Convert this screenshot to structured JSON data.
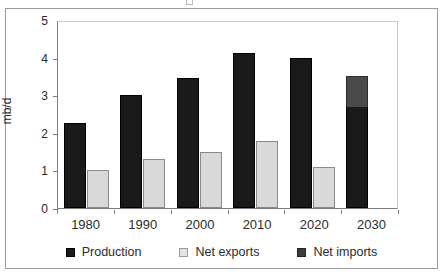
{
  "figure": {
    "background": "#ffffff",
    "frame_color": "#9a9a9a"
  },
  "chart_data": {
    "type": "bar",
    "title": "",
    "subtitle": "",
    "xlabel": "",
    "ylabel": "mb/d",
    "categories": [
      "1980",
      "1990",
      "2000",
      "2010",
      "2020",
      "2030"
    ],
    "ylim": [
      0,
      5
    ],
    "yticks": [
      "0",
      "1",
      "2",
      "3",
      "4",
      "5"
    ],
    "grid": false,
    "legend_position": "bottom",
    "stacked_note": "Net imports is stacked on top of Production in 2030 only",
    "series": [
      {
        "name": "Production",
        "color": "#1a1a1a",
        "values": [
          2.25,
          3.0,
          3.45,
          4.12,
          3.98,
          2.72
        ]
      },
      {
        "name": "Net exports",
        "color": "#d9d9d9",
        "values": [
          1.0,
          1.3,
          1.5,
          1.78,
          1.1,
          null
        ]
      },
      {
        "name": "Net imports",
        "color": "#4a4a4a",
        "values": [
          null,
          null,
          null,
          null,
          null,
          0.83
        ]
      }
    ]
  },
  "legend": {
    "items": [
      {
        "label": "Production",
        "swatch": "legend-swatch-production",
        "color": "#1a1a1a"
      },
      {
        "label": "Net exports",
        "swatch": "legend-swatch-net-exports",
        "color": "#d9d9d9"
      },
      {
        "label": "Net imports",
        "swatch": "legend-swatch-net-imports",
        "color": "#4a4a4a"
      }
    ]
  }
}
